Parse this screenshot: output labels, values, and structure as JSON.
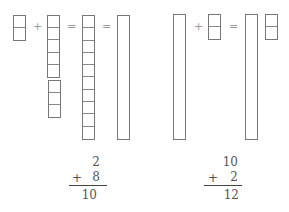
{
  "left": {
    "operators": [
      "+",
      "=",
      "="
    ],
    "addend_blocks_a": 2,
    "addend_blocks_b_top": 5,
    "addend_blocks_b_bottom": 3,
    "sum_blocks": 10,
    "sum_rod": "ten-rod",
    "equation": {
      "top": "2",
      "op": "+",
      "bottom": "8",
      "result": "10"
    }
  },
  "right": {
    "operators": [
      "+",
      "="
    ],
    "rod": "ten-rod",
    "addend_blocks": 2,
    "result_blocks": 2,
    "equation": {
      "top": "10",
      "op": "+",
      "bottom": "2",
      "result": "12"
    }
  }
}
